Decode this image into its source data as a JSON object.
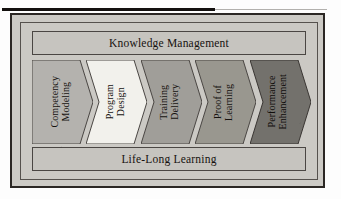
{
  "figure": {
    "title": "",
    "top_band": {
      "label": "Knowledge Management"
    },
    "bottom_band": {
      "label": "Life-Long Learning"
    },
    "chevrons": [
      {
        "label": "Competency\nModeling",
        "fill": "#b4b2ae",
        "stroke": "#4a4643",
        "text_color": "#161210"
      },
      {
        "label": "Program\nDesign",
        "fill": "#f2f1ec",
        "stroke": "#4a4643",
        "text_color": "#161210"
      },
      {
        "label": "Training\nDelivery",
        "fill": "#a09e99",
        "stroke": "#4a4643",
        "text_color": "#161210"
      },
      {
        "label": "Proof of\nLearning",
        "fill": "#99978f",
        "stroke": "#4a4643",
        "text_color": "#161210"
      },
      {
        "label": "Performance\nEnhancement",
        "fill": "#73716c",
        "stroke": "#3a3633",
        "text_color": "#100d0b"
      }
    ],
    "colors": {
      "page_background": "#fdfdfd",
      "frame_background": "#cccac5",
      "panel_background": "#cbc9c4",
      "band_background": "#c6c4bf",
      "frame_border": "#2b2724",
      "rule": "#13100e"
    }
  }
}
